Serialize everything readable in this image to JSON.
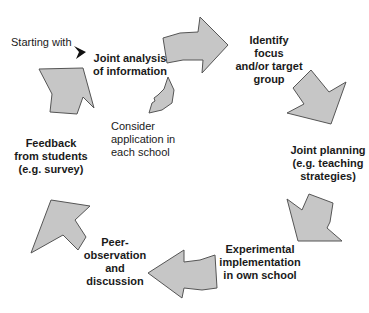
{
  "diagram": {
    "type": "cycle",
    "start_label": "Starting with",
    "steps": [
      {
        "id": "analysis",
        "lines": [
          "Joint analysis",
          "of information"
        ]
      },
      {
        "id": "focus",
        "lines": [
          "Identify",
          "focus",
          "and/or target",
          "group"
        ]
      },
      {
        "id": "planning",
        "lines": [
          "Joint planning",
          "(e.g. teaching",
          "strategies)"
        ]
      },
      {
        "id": "implement",
        "lines": [
          "Experimental",
          "implementation",
          "in own school"
        ]
      },
      {
        "id": "peer",
        "lines": [
          "Peer-",
          "observation",
          "and",
          "discussion"
        ]
      },
      {
        "id": "feedback",
        "lines": [
          "Feedback",
          "from students",
          "(e.g. survey)"
        ]
      }
    ],
    "side_note": {
      "lines": [
        "Consider",
        "application in",
        "each school"
      ]
    },
    "colors": {
      "arrow_fill": "#c6c6c6",
      "arrow_stroke": "#555555",
      "text": "#1a1a1a"
    }
  }
}
